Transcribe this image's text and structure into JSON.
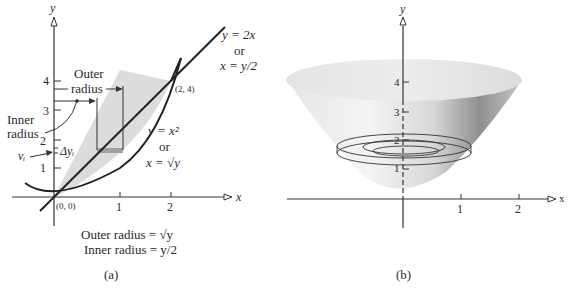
{
  "panel_a": {
    "caption": "(a)",
    "axis": {
      "x_label": "x",
      "y_label": "y",
      "x_ticks": [
        "1",
        "2"
      ],
      "y_ticks": [
        "1",
        "2",
        "3",
        "4"
      ]
    },
    "curves": {
      "line": {
        "eq1": "y = 2x",
        "or": "or",
        "eq2": "x = y/2"
      },
      "parabola": {
        "eq1": "y = x²",
        "or": "or",
        "eq2": "x = √y"
      }
    },
    "points": {
      "origin": "(0, 0)",
      "intersection": "(2, 4)"
    },
    "annotations": {
      "outer_radius_line1": "Outer",
      "outer_radius_line2": "radius",
      "inner_radius_line1": "Inner",
      "inner_radius_line2": "radius",
      "volume_element": "vᵢ",
      "delta_y": "Δyᵢ"
    },
    "formulas": {
      "outer": "Outer radius = √y",
      "inner": "Inner radius = y/2"
    },
    "colors": {
      "region_fill": "#d9d9d9",
      "strip_fill": "#9a9a9a",
      "line": "#222222"
    }
  },
  "panel_b": {
    "caption": "(b)",
    "axis": {
      "x_label": "x",
      "y_label": "y",
      "x_ticks": [
        "1",
        "2"
      ],
      "y_ticks": [
        "1",
        "2",
        "3",
        "4"
      ]
    },
    "colors": {
      "surface_light": "#f0f0f0",
      "surface_dark": "#8c8c8c"
    }
  }
}
